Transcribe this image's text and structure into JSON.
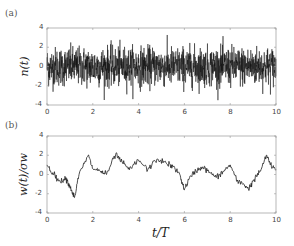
{
  "chart_data": [
    {
      "panel": "(a)",
      "type": "line",
      "title": "",
      "xlabel": "",
      "ylabel": "n(t)",
      "xlim": [
        0,
        10
      ],
      "ylim": [
        -4,
        4
      ],
      "xticks": [
        0,
        2,
        4,
        6,
        8,
        10
      ],
      "yticks": [
        -4,
        -2,
        0,
        2,
        4
      ],
      "grid": false,
      "description": "Dense white-noise signal centered at 0, mostly within ±2, extremes near ±3.5",
      "series": [
        {
          "name": "n(t)",
          "style": "noise",
          "mean": 0,
          "std": 1.0,
          "min": -3.5,
          "max": 3.6
        }
      ]
    },
    {
      "panel": "(b)",
      "type": "line",
      "title": "",
      "xlabel": "t/T",
      "ylabel": "w(t)/σ_w",
      "xlim": [
        0,
        10
      ],
      "ylim": [
        -4,
        4
      ],
      "xticks": [
        0,
        2,
        4,
        6,
        8,
        10
      ],
      "yticks": [
        -4,
        -2,
        0,
        2,
        4
      ],
      "grid": false,
      "series": [
        {
          "name": "w(t)/σ_w",
          "x": [
            0,
            0.3,
            0.6,
            0.8,
            1.0,
            1.2,
            1.4,
            1.8,
            2.0,
            2.3,
            2.6,
            3.0,
            3.3,
            3.6,
            4.0,
            4.4,
            4.8,
            5.2,
            5.5,
            5.8,
            6.0,
            6.2,
            6.5,
            6.8,
            7.1,
            7.4,
            7.7,
            8.0,
            8.3,
            8.6,
            8.8,
            9.0,
            9.3,
            9.6,
            9.8,
            10.0
          ],
          "y": [
            1.0,
            0.0,
            -0.8,
            -0.3,
            -1.2,
            -2.4,
            0.0,
            2.0,
            0.6,
            0.4,
            0.0,
            2.1,
            1.2,
            0.5,
            1.5,
            0.5,
            1.6,
            1.2,
            0.8,
            0.0,
            -1.6,
            -0.5,
            0.4,
            0.8,
            0.2,
            -0.3,
            0.3,
            1.0,
            -0.7,
            -1.0,
            -1.5,
            -0.7,
            0.3,
            2.0,
            0.8,
            0.5
          ]
        }
      ]
    }
  ],
  "labels": {
    "panel_a": "(a)",
    "panel_b": "(b)",
    "ylabel_a": "n(t)",
    "ylabel_b": "w(t)/σw",
    "xlabel_b": "t/T",
    "xticks": [
      "0",
      "2",
      "4",
      "6",
      "8",
      "10"
    ],
    "yticks": [
      "4",
      "2",
      "0",
      "-2",
      "-4"
    ]
  }
}
